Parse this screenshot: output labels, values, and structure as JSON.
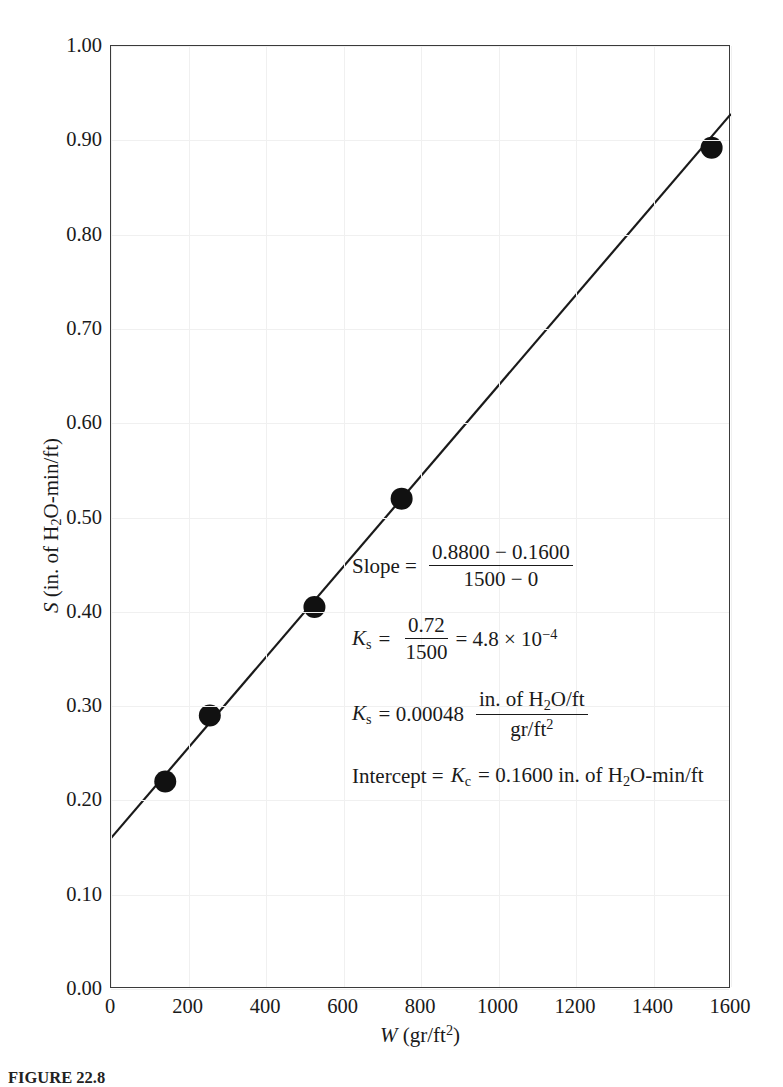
{
  "figure": {
    "caption_number": "FIGURE 22.8",
    "caption_text": "صfilter media Wب  …"
  },
  "axes": {
    "y_ticks": [
      "0.00",
      "0.10",
      "0.20",
      "0.30",
      "0.40",
      "0.50",
      "0.60",
      "0.70",
      "0.80",
      "0.90",
      "1.00"
    ],
    "x_ticks": [
      "0",
      "200",
      "400",
      "600",
      "800",
      "1000",
      "1200",
      "1400",
      "1600"
    ],
    "y_label_var": "S",
    "y_label_units_pre": " (in. of H",
    "y_label_units_sub": "2",
    "y_label_units_post": "O-min/ft)",
    "x_label_var": "W",
    "x_label_units_pre": " (gr/ft",
    "x_label_units_sup": "2",
    "x_label_units_post": ")"
  },
  "annotations": {
    "slope": {
      "lead": "Slope =",
      "numerator": "0.8800 − 0.1600",
      "denominator": "1500 − 0"
    },
    "ks_calc": {
      "var": "K",
      "var_sub": "s",
      "eq1": "=",
      "numerator": "0.72",
      "denominator": "1500",
      "eq2": "= 4.8 × 10",
      "exponent": "−4"
    },
    "ks_value": {
      "var": "K",
      "var_sub": "s",
      "eq": "= 0.00048",
      "numerator_pre": "in. of H",
      "numerator_sub": "2",
      "numerator_post": "O/ft",
      "denominator_pre": "gr/ft",
      "denominator_sup": "2"
    },
    "intercept": {
      "lead": "Intercept =",
      "var": "K",
      "var_sub": "c",
      "value": "= 0.1600 in. of H",
      "value_sub": "2",
      "value_post": "O-min/ft"
    }
  },
  "colors": {
    "axis": "#3a3a3a",
    "grid": "#f0f0f0",
    "line": "#1a1a1a",
    "marker": "#111111",
    "background": "#ffffff"
  },
  "chart_data": {
    "type": "scatter",
    "title": "",
    "xlabel": "W (gr/ft^2)",
    "ylabel": "S (in. of H2O-min/ft)",
    "xlim": [
      0,
      1600
    ],
    "ylim": [
      0.0,
      1.0
    ],
    "xticks": [
      0,
      200,
      400,
      600,
      800,
      1000,
      1200,
      1400,
      1600
    ],
    "yticks": [
      0.0,
      0.1,
      0.2,
      0.3,
      0.4,
      0.5,
      0.6,
      0.7,
      0.8,
      0.9,
      1.0
    ],
    "grid": true,
    "legend": "none",
    "series": [
      {
        "name": "Measured points",
        "marker": "filled-circle",
        "x": [
          140,
          255,
          525,
          750,
          1550
        ],
        "y": [
          0.22,
          0.29,
          0.405,
          0.52,
          0.892
        ]
      },
      {
        "name": "Least-squares fit line",
        "type": "line",
        "x": [
          0,
          1600
        ],
        "y": [
          0.16,
          0.928
        ],
        "slope": 0.00048,
        "intercept": 0.16
      }
    ],
    "annotations": [
      "Slope = (0.8800 - 0.1600) / (1500 - 0)",
      "Ks = 0.72 / 1500 = 4.8 x 10^-4",
      "Ks = 0.00048 (in. of H2O/ft) / (gr/ft^2)",
      "Intercept = Kc = 0.1600 in. of H2O-min/ft"
    ]
  }
}
